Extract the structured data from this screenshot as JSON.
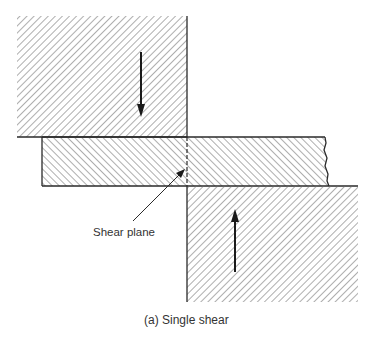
{
  "figure": {
    "caption": "(a)  Single shear",
    "annotation": "Shear plane"
  },
  "parts": {
    "top_block": {
      "hatch": "forward",
      "force_direction": "down"
    },
    "middle_bar": {
      "hatch_left": "backward",
      "hatch_right": "backward",
      "right_edge": "broken"
    },
    "bottom_block": {
      "hatch": "forward",
      "force_direction": "up"
    }
  },
  "colors": {
    "line": "#2a2a2a",
    "hatch": "#6a6a6a",
    "text": "#333333",
    "background": "#ffffff"
  }
}
